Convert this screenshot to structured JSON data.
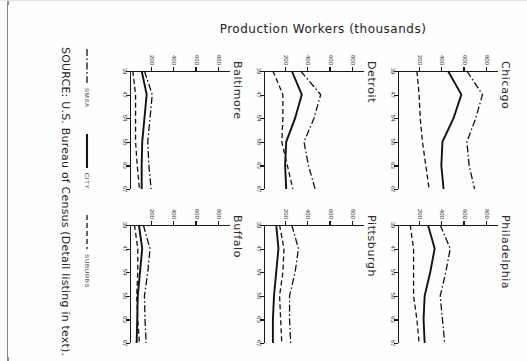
{
  "figure": {
    "y_axis_title": "Production Workers (thousands)",
    "source_note": "SOURCE: U.S. Bureau of Census (Detail listing in text).",
    "y_ticks": [
      "800",
      "600",
      "400",
      "200"
    ],
    "x_ticks": [
      "39",
      "47",
      "54",
      "58",
      "63",
      "67"
    ]
  },
  "legend": {
    "items": [
      {
        "label": "SMSA",
        "style": "dash-dot",
        "swatch_icon": "dash-dot-line-icon"
      },
      {
        "label": "CITY",
        "style": "solid",
        "swatch_icon": "solid-line-icon"
      },
      {
        "label": "SUBURBS",
        "style": "dashed",
        "swatch_icon": "dashed-line-icon"
      }
    ]
  },
  "chart_data": {
    "type": "line",
    "title": "Production Workers (thousands)",
    "xlabel": "",
    "ylabel": "Production Workers (thousands)",
    "x": [
      39,
      47,
      54,
      58,
      63,
      67
    ],
    "xtick_labels": [
      "39",
      "47",
      "54",
      "58",
      "63",
      "67"
    ],
    "ylim": [
      0,
      900
    ],
    "ytick_values": [
      800,
      600,
      400,
      200
    ],
    "grid": false,
    "legend_position": "bottom",
    "series_names": [
      "SMSA",
      "CITY",
      "SUBURBS"
    ],
    "panels": [
      {
        "name": "Chicago",
        "series": [
          {
            "name": "SMSA",
            "values": [
              620,
              760,
              700,
              620,
              640,
              690
            ]
          },
          {
            "name": "CITY",
            "values": [
              450,
              570,
              500,
              400,
              390,
              410
            ]
          },
          {
            "name": "SUBURBS",
            "values": [
              170,
              190,
              200,
              220,
              250,
              280
            ]
          }
        ]
      },
      {
        "name": "Philadelphia",
        "series": [
          {
            "name": "SMSA",
            "values": [
              380,
              470,
              430,
              380,
              400,
              420
            ]
          },
          {
            "name": "CITY",
            "values": [
              270,
              330,
              290,
              240,
              230,
              240
            ]
          },
          {
            "name": "SUBURBS",
            "values": [
              110,
              140,
              140,
              140,
              170,
              190
            ]
          }
        ]
      },
      {
        "name": "Detroit",
        "series": [
          {
            "name": "SMSA",
            "values": [
              330,
              510,
              450,
              360,
              400,
              460
            ]
          },
          {
            "name": "CITY",
            "values": [
              250,
              340,
              280,
              200,
              190,
              200
            ]
          },
          {
            "name": "SUBURBS",
            "values": [
              80,
              170,
              170,
              160,
              210,
              260
            ]
          }
        ]
      },
      {
        "name": "Pittsburgh",
        "series": [
          {
            "name": "SMSA",
            "values": [
              250,
              310,
              280,
              230,
              230,
              240
            ]
          },
          {
            "name": "CITY",
            "values": [
              110,
              130,
              110,
              90,
              80,
              80
            ]
          },
          {
            "name": "SUBURBS",
            "values": [
              140,
              180,
              170,
              140,
              150,
              160
            ]
          }
        ]
      },
      {
        "name": "Baltimore",
        "series": [
          {
            "name": "SMSA",
            "values": [
              130,
              200,
              180,
              160,
              170,
              190
            ]
          },
          {
            "name": "CITY",
            "values": [
              105,
              150,
              130,
              110,
              105,
              105
            ]
          },
          {
            "name": "SUBURBS",
            "values": [
              25,
              50,
              50,
              50,
              65,
              85
            ]
          }
        ]
      },
      {
        "name": "Buffalo",
        "series": [
          {
            "name": "SMSA",
            "values": [
              120,
              180,
              160,
              130,
              135,
              145
            ]
          },
          {
            "name": "CITY",
            "values": [
              80,
              110,
              90,
              70,
              65,
              60
            ]
          },
          {
            "name": "SUBURBS",
            "values": [
              40,
              70,
              70,
              60,
              70,
              85
            ]
          }
        ]
      }
    ]
  }
}
